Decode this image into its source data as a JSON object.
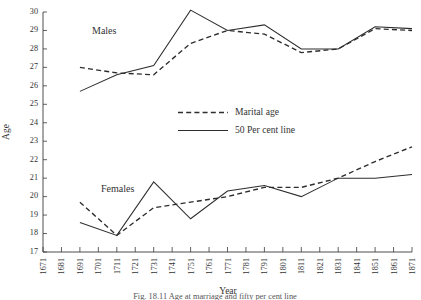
{
  "figure": {
    "caption": "Fig. 18.11  Age at marriage and fifty per cent line",
    "group_labels": {
      "males": "Males",
      "females": "Females"
    }
  },
  "chart_data": {
    "type": "line",
    "title": "",
    "xlabel": "Year",
    "ylabel": "Age",
    "xlim": [
      1671,
      1871
    ],
    "ylim": [
      17,
      30
    ],
    "grid": false,
    "legend_position": "center",
    "x_tick_labels": [
      "1671",
      "1681",
      "1691",
      "1701",
      "1711",
      "1721",
      "1731",
      "1741",
      "1751",
      "1761",
      "1771",
      "1781",
      "1791",
      "1801",
      "1811",
      "1821",
      "1831",
      "1841",
      "1851",
      "1861",
      "1871"
    ],
    "x_ticks": [
      1671,
      1681,
      1691,
      1701,
      1711,
      1721,
      1731,
      1741,
      1751,
      1761,
      1771,
      1781,
      1791,
      1801,
      1811,
      1821,
      1831,
      1841,
      1851,
      1861,
      1871
    ],
    "y_tick_labels": [
      "17",
      "18",
      "19",
      "20",
      "21",
      "22",
      "23",
      "24",
      "25",
      "26",
      "27",
      "28",
      "29",
      "30"
    ],
    "y_ticks": [
      17,
      18,
      19,
      20,
      21,
      22,
      23,
      24,
      25,
      26,
      27,
      28,
      29,
      30
    ],
    "legend": [
      {
        "name": "Marital age",
        "style": "dashed"
      },
      {
        "name": "50 Per cent line",
        "style": "solid"
      }
    ],
    "x": [
      1691,
      1711,
      1731,
      1751,
      1771,
      1791,
      1811,
      1831,
      1851,
      1871
    ],
    "series": [
      {
        "name": "Marital age",
        "group": "Males",
        "style": "dashed",
        "values": [
          27.0,
          26.7,
          26.6,
          28.3,
          29.0,
          28.8,
          27.8,
          28.0,
          29.1,
          29.0
        ]
      },
      {
        "name": "50 Per cent line",
        "group": "Males",
        "style": "solid",
        "values": [
          25.7,
          26.6,
          27.1,
          30.1,
          29.0,
          29.3,
          28.0,
          28.0,
          29.2,
          29.1
        ]
      },
      {
        "name": "Marital age",
        "group": "Females",
        "style": "dashed",
        "values": [
          19.7,
          17.9,
          19.4,
          19.7,
          20.0,
          20.5,
          20.5,
          21.0,
          21.9,
          22.7
        ]
      },
      {
        "name": "50 Per cent line",
        "group": "Females",
        "style": "solid",
        "values": [
          18.6,
          17.9,
          20.8,
          18.8,
          20.3,
          20.6,
          20.0,
          21.0,
          21.0,
          21.2
        ]
      }
    ]
  }
}
